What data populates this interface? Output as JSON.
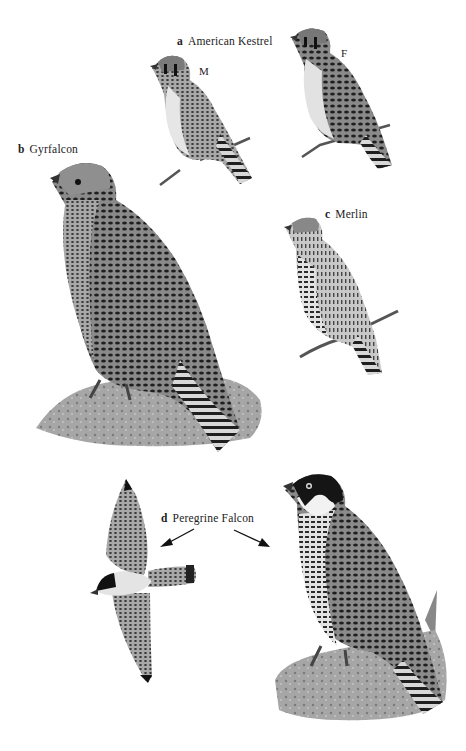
{
  "plate": {
    "species": [
      {
        "letter": "a",
        "name": "American Kestrel",
        "variants": [
          {
            "sex": "M"
          },
          {
            "sex": "F"
          }
        ]
      },
      {
        "letter": "b",
        "name": "Gyrfalcon"
      },
      {
        "letter": "c",
        "name": "Merlin"
      },
      {
        "letter": "d",
        "name": "Peregrine Falcon",
        "views": [
          "in flight (underside)",
          "perched on rock"
        ]
      }
    ]
  },
  "colors": {
    "background": "#ffffff",
    "ink_dark": "#1a1a1a",
    "plumage_mid": "#6b6b6b",
    "plumage_light": "#bdbdbd",
    "rock": "#9a9a9a"
  }
}
